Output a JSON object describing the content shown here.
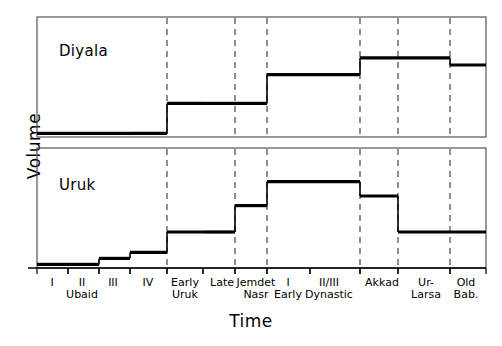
{
  "figure": {
    "axis_labels": {
      "y": "Volume",
      "x": "Time"
    },
    "panels": [
      {
        "id": "diyala",
        "title": "Diyala"
      },
      {
        "id": "uruk",
        "title": "Uruk"
      }
    ],
    "ink_color": "#000000",
    "divider_color": "#555555",
    "background": "#ffffff"
  },
  "tick_labels": [
    {
      "line1": "I",
      "line2": "",
      "x": 52
    },
    {
      "line1": "II",
      "line2": "Ubaid",
      "x": 82
    },
    {
      "line1": "III",
      "line2": "",
      "x": 113
    },
    {
      "line1": "IV",
      "line2": "",
      "x": 148
    },
    {
      "line1": "Early",
      "line2": "Uruk",
      "x": 185
    },
    {
      "line1": "Late",
      "line2": "",
      "x": 222
    },
    {
      "line1": "Jemdet",
      "line2": "Nasr",
      "x": 256
    },
    {
      "line1": "I",
      "line2": "Early",
      "x": 288
    },
    {
      "line1": "II/III",
      "line2": "Dynastic",
      "x": 329
    },
    {
      "line1": "Akkad",
      "line2": "",
      "x": 382
    },
    {
      "line1": "Ur-",
      "line2": "Larsa",
      "x": 426
    },
    {
      "line1": "Old",
      "line2": "Bab.",
      "x": 466
    }
  ],
  "chart_data": {
    "type": "bar",
    "title": "",
    "xlabel": "Time",
    "ylabel": "Volume",
    "grid": false,
    "legend": "none",
    "note": "Two stacked step/bar panels sharing one categorical time axis of Mesopotamian archaeological periods. Values are relative volume estimates read off the panel heights (0 = panel baseline, 1 = panel top).",
    "categories": [
      "Ubaid I",
      "Ubaid II",
      "Ubaid III",
      "Ubaid IV",
      "Early Uruk",
      "Late Uruk",
      "Jemdet Nasr",
      "Early Dynastic I",
      "Early Dynastic II/III",
      "Akkad",
      "Ur-Larsa",
      "Old Bab."
    ],
    "category_spans": [
      {
        "label": "Ubaid I",
        "x0": 37,
        "x1": 68
      },
      {
        "label": "Ubaid II",
        "x0": 68,
        "x1": 99
      },
      {
        "label": "Ubaid III",
        "x0": 99,
        "x1": 130
      },
      {
        "label": "Ubaid IV",
        "x0": 130,
        "x1": 167
      },
      {
        "label": "Early Uruk",
        "x0": 167,
        "x1": 203
      },
      {
        "label": "Late Uruk",
        "x0": 203,
        "x1": 235
      },
      {
        "label": "Jemdet Nasr",
        "x0": 235,
        "x1": 267
      },
      {
        "label": "Early Dynastic I",
        "x0": 267,
        "x1": 310
      },
      {
        "label": "Early Dynastic II/III",
        "x0": 310,
        "x1": 360
      },
      {
        "label": "Akkad",
        "x0": 360,
        "x1": 398
      },
      {
        "label": "Ur-Larsa",
        "x0": 398,
        "x1": 450
      },
      {
        "label": "Old Bab.",
        "x0": 450,
        "x1": 486
      }
    ],
    "period_dividers": [
      167,
      235,
      267,
      360,
      398,
      450
    ],
    "series": [
      {
        "name": "Diyala",
        "panel": "diyala",
        "ylim": [
          0,
          1
        ],
        "values": [
          0.03,
          0.03,
          0.03,
          0.03,
          0.28,
          0.28,
          0.28,
          0.52,
          0.52,
          0.66,
          0.66,
          0.6
        ]
      },
      {
        "name": "Uruk",
        "panel": "uruk",
        "ylim": [
          0,
          1
        ],
        "values": [
          0.03,
          0.03,
          0.08,
          0.13,
          0.3,
          0.3,
          0.52,
          0.72,
          0.72,
          0.6,
          0.3,
          0.3
        ]
      }
    ]
  }
}
